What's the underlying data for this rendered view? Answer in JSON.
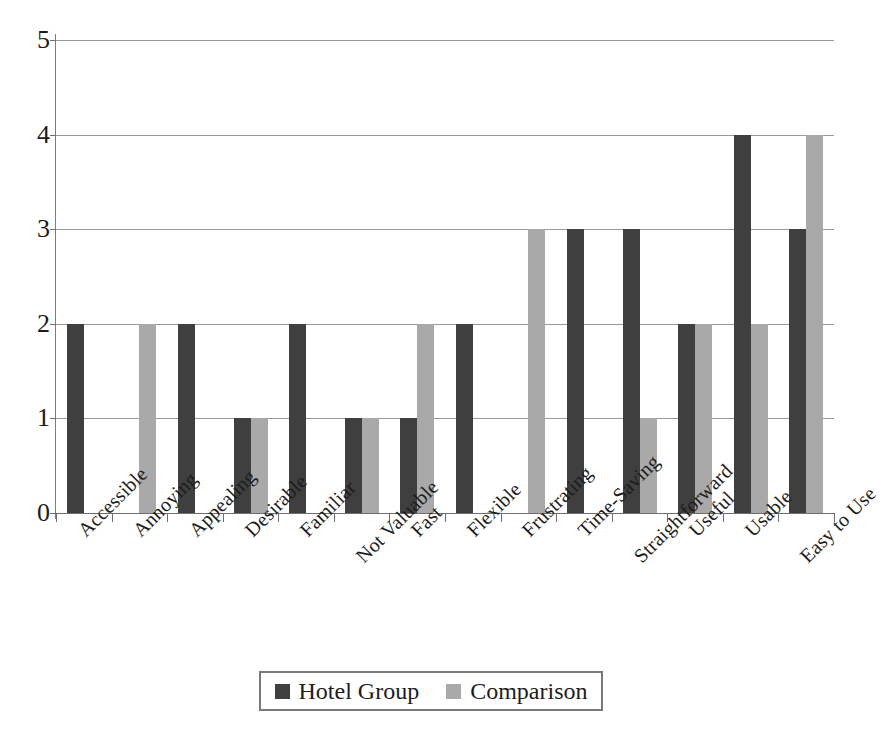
{
  "chart_data": {
    "type": "bar",
    "title": "",
    "xlabel": "",
    "ylabel": "",
    "ylim": [
      0,
      5
    ],
    "ytick_labels": [
      "0",
      "1",
      "2",
      "3",
      "4",
      "5"
    ],
    "grid": true,
    "legend_position": "bottom",
    "categories": [
      "Accessible",
      "Annoying",
      "Appealing",
      "Desirable",
      "Familiar",
      "Not Valuable",
      "Fast",
      "Flexible",
      "Frustrating",
      "Time-Saving",
      "Straightforward",
      "Useful",
      "Usable",
      "Easy to Use"
    ],
    "series": [
      {
        "name": "Hotel Group",
        "color": "#3f3f3f",
        "values": [
          2,
          0,
          2,
          1,
          2,
          1,
          1,
          2,
          0,
          3,
          3,
          2,
          4,
          3
        ]
      },
      {
        "name": "Comparison",
        "color": "#a9a9a9",
        "values": [
          0,
          2,
          0,
          1,
          0,
          1,
          2,
          0,
          3,
          0,
          1,
          2,
          2,
          4
        ]
      }
    ]
  },
  "legend": {
    "items": [
      {
        "label": "Hotel Group",
        "color": "#3f3f3f"
      },
      {
        "label": "Comparison",
        "color": "#a9a9a9"
      }
    ]
  }
}
